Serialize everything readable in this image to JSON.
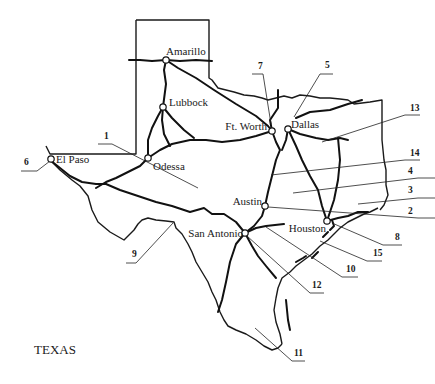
{
  "map": {
    "title": "TEXAS",
    "cities": [
      {
        "name": "Amarillo",
        "x": 166,
        "y": 60,
        "lx": 166,
        "ly": 55,
        "anchor": "start"
      },
      {
        "name": "Lubbock",
        "x": 163,
        "y": 107,
        "lx": 169,
        "ly": 106,
        "anchor": "start"
      },
      {
        "name": "Odessa",
        "x": 148,
        "y": 158,
        "lx": 153,
        "ly": 170,
        "anchor": "start"
      },
      {
        "name": "El Paso",
        "x": 51,
        "y": 159,
        "lx": 56,
        "ly": 163,
        "anchor": "start"
      },
      {
        "name": "Ft. Worth",
        "x": 272,
        "y": 131,
        "lx": 267,
        "ly": 130,
        "anchor": "end"
      },
      {
        "name": "Dallas",
        "x": 288,
        "y": 129,
        "lx": 291,
        "ly": 128,
        "anchor": "start"
      },
      {
        "name": "Austin",
        "x": 265,
        "y": 206,
        "lx": 262,
        "ly": 205,
        "anchor": "end"
      },
      {
        "name": "Houston",
        "x": 327,
        "y": 221,
        "lx": 326,
        "ly": 232,
        "anchor": "end"
      },
      {
        "name": "San Antonio",
        "x": 245,
        "y": 233,
        "lx": 243,
        "ly": 237,
        "anchor": "end"
      }
    ],
    "numbered_labels": [
      {
        "num": "1",
        "tx": 104,
        "ty": 139,
        "line": "M98 144 L112 144 L198 188"
      },
      {
        "num": "2",
        "tx": 408,
        "ty": 214,
        "line": "M268 207 L418 218 L435 218"
      },
      {
        "num": "3",
        "tx": 408,
        "ty": 193,
        "line": "M358 204 L418 198 L435 198"
      },
      {
        "num": "4",
        "tx": 408,
        "ty": 174,
        "line": "M293 193 L418 178 L435 178"
      },
      {
        "name": "5",
        "num": "5",
        "tx": 325,
        "ty": 68,
        "line": "M294 117 L320 74 L333 74"
      },
      {
        "num": "6",
        "tx": 24,
        "ty": 165,
        "line": "M21 171 L37 171 L50 161"
      },
      {
        "num": "7",
        "tx": 258,
        "ty": 69,
        "line": "M252 74 L263 74 L271 124"
      },
      {
        "num": "8",
        "tx": 395,
        "ty": 240,
        "line": "M332 223 L383 245 L402 245"
      },
      {
        "num": "9",
        "tx": 132,
        "ty": 257,
        "line": "M126 263 L136 263 L173 223"
      },
      {
        "num": "10",
        "tx": 346,
        "ty": 272,
        "line": "M266 227 L342 277 L358 277"
      },
      {
        "num": "11",
        "tx": 294,
        "ty": 356,
        "line": "M255 328 L292 361 L305 361"
      },
      {
        "num": "12",
        "tx": 312,
        "ty": 288,
        "line": "M247 236 L310 293 L324 293"
      },
      {
        "num": "13",
        "tx": 410,
        "ty": 111,
        "line": "M322 142 L405 115 L420 115"
      },
      {
        "num": "14",
        "tx": 410,
        "ty": 156,
        "line": "M271 175 L405 160 L420 160"
      },
      {
        "num": "15",
        "tx": 373,
        "ty": 256,
        "line": "M320 241 L367 261 L382 261"
      }
    ]
  }
}
